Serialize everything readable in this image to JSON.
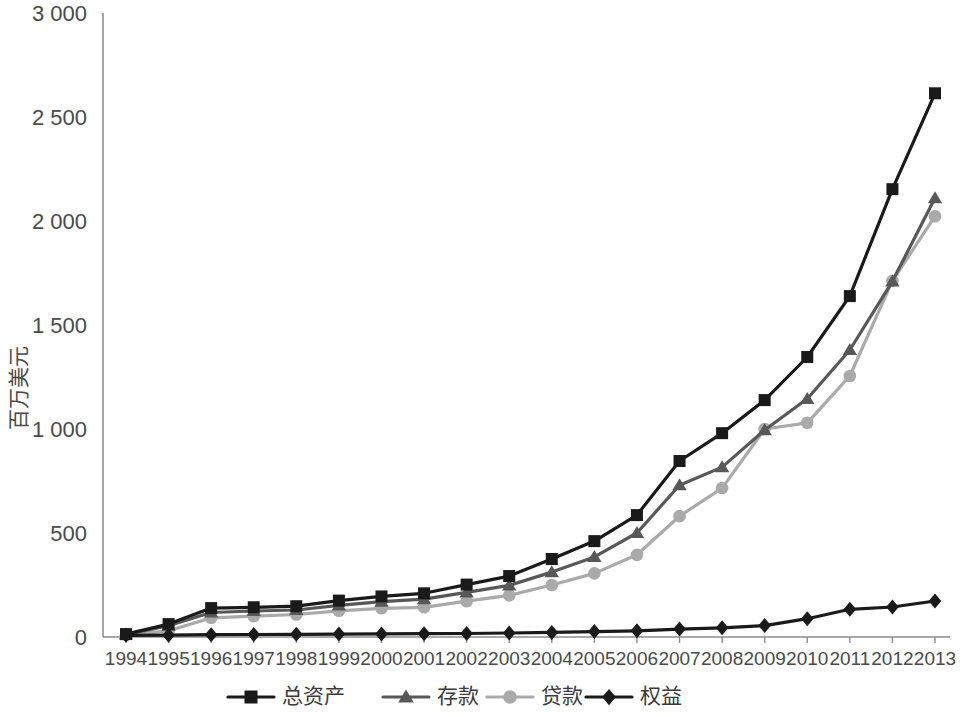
{
  "chart_data": {
    "type": "line",
    "title": "",
    "xlabel": "",
    "ylabel": "百万美元",
    "ylim": [
      0,
      3000
    ],
    "ytick_labels": [
      "0",
      "500",
      "1 000",
      "1 500",
      "2 000",
      "2 500",
      "3 000"
    ],
    "ytick_values": [
      0,
      500,
      1000,
      1500,
      2000,
      2500,
      3000
    ],
    "grid": false,
    "legend_position": "bottom",
    "categories": [
      "1994",
      "1995",
      "1996",
      "1997",
      "1998",
      "1999",
      "2000",
      "2001",
      "2002",
      "2003",
      "2004",
      "2005",
      "2006",
      "2007",
      "2008",
      "2009",
      "2010",
      "2011",
      "2012",
      "2013"
    ],
    "x": [
      1994,
      1995,
      1996,
      1997,
      1998,
      1999,
      2000,
      2001,
      2002,
      2003,
      2004,
      2005,
      2006,
      2007,
      2008,
      2009,
      2010,
      2011,
      2012,
      2013
    ],
    "series": [
      {
        "name": "总资产",
        "marker": "square",
        "color": "#1a1a1a",
        "values": [
          14,
          62,
          139,
          143,
          148,
          175,
          195,
          210,
          252,
          293,
          375,
          461,
          586,
          846,
          980,
          1139,
          1346,
          1639,
          2153,
          2614
        ]
      },
      {
        "name": "存款",
        "marker": "triangle",
        "color": "#585858",
        "values": [
          12,
          55,
          118,
          125,
          130,
          152,
          170,
          182,
          215,
          248,
          312,
          385,
          500,
          730,
          817,
          995,
          1145,
          1380,
          1710,
          2110
        ]
      },
      {
        "name": "贷款",
        "marker": "circle",
        "color": "#aaaaaa",
        "values": [
          10,
          30,
          92,
          100,
          108,
          126,
          138,
          143,
          172,
          200,
          250,
          306,
          395,
          581,
          716,
          1000,
          1030,
          1255,
          1712,
          2023
        ]
      },
      {
        "name": "权益",
        "marker": "diamond",
        "color": "#1a1a1a",
        "values": [
          8,
          9,
          11,
          12,
          13,
          14,
          15,
          16,
          17,
          19,
          22,
          26,
          30,
          38,
          44,
          55,
          88,
          133,
          144,
          173
        ]
      }
    ]
  },
  "legend": {
    "entries": [
      {
        "label": "总资产"
      },
      {
        "label": "存款"
      },
      {
        "label": "贷款"
      },
      {
        "label": "权益"
      }
    ]
  },
  "axes": {
    "y_title": "百万美元"
  }
}
